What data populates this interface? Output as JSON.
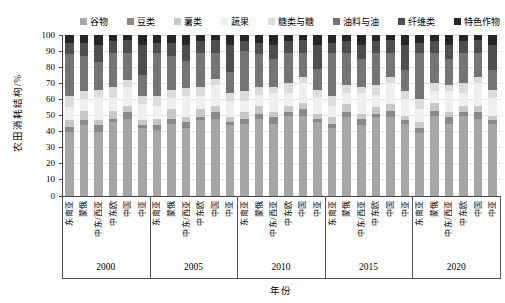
{
  "chart_data": {
    "type": "bar",
    "stacked": true,
    "percent": true,
    "title": "",
    "xlabel": "年份",
    "ylabel": "农田消耗结构/%",
    "ylim": [
      0,
      100
    ],
    "yticks": [
      0,
      10,
      20,
      30,
      40,
      50,
      60,
      70,
      80,
      90,
      100
    ],
    "grid": true,
    "legend_position": "top",
    "categories": [
      "谷物",
      "豆类",
      "薯类",
      "蔬果",
      "糖类与糖",
      "油料与油",
      "纤维类",
      "特色作物"
    ],
    "colors": [
      "#a6a6a6",
      "#898989",
      "#c8c8c8",
      "#efefef",
      "#dcdcdc",
      "#757575",
      "#4f4f4f",
      "#262626"
    ],
    "regions": [
      "东南亚",
      "蒙俄",
      "中东/西亚",
      "中东欧",
      "中国",
      "中亚"
    ],
    "years": [
      "2000",
      "2005",
      "2010",
      "2015",
      "2020"
    ],
    "groups": [
      {
        "year": "2000",
        "bars": [
          {
            "region": "东南亚",
            "values": [
              40,
              3,
              4,
              8,
              7,
              26,
              7,
              5
            ]
          },
          {
            "region": "蒙俄",
            "values": [
              44,
              3,
              6,
              7,
              5,
              22,
              8,
              5
            ]
          },
          {
            "region": "中东/西亚",
            "values": [
              40,
              4,
              3,
              14,
              5,
              17,
              11,
              6
            ]
          },
          {
            "region": "中东欧",
            "values": [
              46,
              2,
              5,
              8,
              7,
              21,
              7,
              4
            ]
          },
          {
            "region": "中国",
            "values": [
              48,
              4,
              4,
              12,
              4,
              17,
              8,
              3
            ]
          },
          {
            "region": "中亚",
            "values": [
              42,
              2,
              3,
              10,
              5,
              13,
              19,
              6
            ]
          }
        ]
      },
      {
        "year": "2005",
        "bars": [
          {
            "region": "东南亚",
            "values": [
              41,
              3,
              4,
              8,
              6,
              27,
              6,
              5
            ]
          },
          {
            "region": "蒙俄",
            "values": [
              45,
              3,
              6,
              7,
              5,
              21,
              8,
              5
            ]
          },
          {
            "region": "中东/西亚",
            "values": [
              42,
              4,
              3,
              13,
              5,
              17,
              10,
              6
            ]
          },
          {
            "region": "中东欧",
            "values": [
              47,
              2,
              5,
              8,
              6,
              21,
              7,
              4
            ]
          },
          {
            "region": "中国",
            "values": [
              48,
              4,
              4,
              13,
              4,
              16,
              8,
              3
            ]
          },
          {
            "region": "中亚",
            "values": [
              44,
              2,
              3,
              10,
              5,
              13,
              17,
              6
            ]
          }
        ]
      },
      {
        "year": "2010",
        "bars": [
          {
            "region": "东南亚",
            "values": [
              45,
              3,
              4,
              7,
              6,
              25,
              6,
              4
            ]
          },
          {
            "region": "蒙俄",
            "values": [
              48,
              3,
              5,
              7,
              5,
              20,
              7,
              5
            ]
          },
          {
            "region": "中东/西亚",
            "values": [
              45,
              4,
              3,
              12,
              4,
              17,
              9,
              6
            ]
          },
          {
            "region": "中东欧",
            "values": [
              50,
              2,
              4,
              8,
              6,
              19,
              7,
              4
            ]
          },
          {
            "region": "中国",
            "values": [
              50,
              4,
              4,
              12,
              4,
              15,
              8,
              3
            ]
          },
          {
            "region": "中亚",
            "values": [
              46,
              2,
              3,
              10,
              5,
              13,
              15,
              6
            ]
          }
        ]
      },
      {
        "year": "2015",
        "bars": [
          {
            "region": "东南亚",
            "values": [
              42,
              3,
              4,
              7,
              6,
              27,
              6,
              5
            ]
          },
          {
            "region": "蒙俄",
            "values": [
              49,
              3,
              5,
              7,
              5,
              20,
              7,
              4
            ]
          },
          {
            "region": "中东/西亚",
            "values": [
              44,
              4,
              3,
              13,
              4,
              17,
              9,
              6
            ]
          },
          {
            "region": "中东欧",
            "values": [
              49,
              2,
              4,
              8,
              6,
              20,
              7,
              4
            ]
          },
          {
            "region": "中国",
            "values": [
              49,
              4,
              4,
              13,
              4,
              15,
              8,
              3
            ]
          },
          {
            "region": "中亚",
            "values": [
              45,
              2,
              3,
              10,
              5,
              13,
              16,
              6
            ]
          }
        ]
      },
      {
        "year": "2020",
        "bars": [
          {
            "region": "东南亚",
            "values": [
              39,
              3,
              4,
              8,
              6,
              29,
              6,
              5
            ]
          },
          {
            "region": "蒙俄",
            "values": [
              50,
              3,
              5,
              7,
              5,
              19,
              7,
              4
            ]
          },
          {
            "region": "中东/西亚",
            "values": [
              45,
              4,
              3,
              13,
              4,
              16,
              9,
              6
            ]
          },
          {
            "region": "中东欧",
            "values": [
              50,
              2,
              4,
              8,
              6,
              19,
              7,
              4
            ]
          },
          {
            "region": "中国",
            "values": [
              48,
              4,
              4,
              14,
              4,
              15,
              8,
              3
            ]
          },
          {
            "region": "中亚",
            "values": [
              45,
              2,
              3,
              11,
              5,
              12,
              16,
              6
            ]
          }
        ]
      }
    ]
  }
}
